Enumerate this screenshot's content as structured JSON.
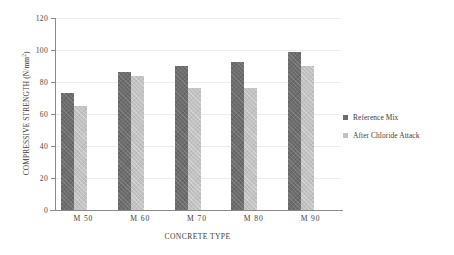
{
  "chart_data": {
    "type": "bar",
    "title": "",
    "xlabel": "CONCRETE TYPE",
    "ylabel": "COMPRESSIVE STRENGTH (N/mm",
    "ylabel_superscript": "2",
    "ylabel_suffix": ")",
    "categories": [
      "M 50",
      "M 60",
      "M 70",
      "M 80",
      "M 90"
    ],
    "series": [
      {
        "name": "Reference Mix",
        "color": "#6d6d6d",
        "values": [
          73,
          86,
          90,
          92.5,
          99
        ]
      },
      {
        "name": "After Chloride Attack",
        "color": "#c2c2c2",
        "values": [
          65,
          84,
          76,
          76.5,
          90
        ]
      }
    ],
    "ylim": [
      0,
      120
    ],
    "yticks": [
      0,
      20,
      40,
      60,
      80,
      100,
      120
    ],
    "ytick_labels": [
      "0",
      "20",
      "40",
      "60",
      "80",
      "100",
      "120"
    ],
    "grid": true,
    "legend_position": "right"
  }
}
